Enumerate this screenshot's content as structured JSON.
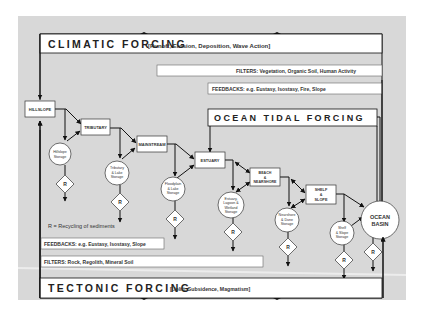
{
  "diagram": {
    "background_color": "#d8d8d8",
    "climatic_forcing": {
      "title": "CLIMATIC FORCING",
      "subtitle": "[Runoff, Erosion, Deposition, Wave Action]"
    },
    "filters_top": "FILTERS: Vegetation, Organic Soil, Human Activity",
    "feedbacks_top": "FEEDBACKS: e.g. Eustasy, Isostasy, Fire, Slope",
    "ocean_tidal_forcing": "OCEAN TIDAL FORCING",
    "nodes": {
      "hillslope": "HILLSLOPE",
      "tributary": "TRIBUTARY",
      "mainstream": "MAINSTREAM",
      "estuary": "ESTUARY",
      "beach_1": "BEACH",
      "beach_2": "&",
      "beach_3": "NEARSHORE",
      "shelf_1": "SHELF",
      "shelf_2": "&",
      "shelf_3": "SLOPE",
      "ocean_1": "OCEAN",
      "ocean_2": "BASIN"
    },
    "storages": {
      "hillslope_1": "Hillslope",
      "hillslope_2": "Storage",
      "tributary_1": "Tributary",
      "tributary_2": "& Lake",
      "tributary_3": "Storage",
      "floodplain_1": "Floodplain",
      "floodplain_2": "& Lake",
      "floodplain_3": "Storage",
      "estuary_1": "Estuary,",
      "estuary_2": "Lagoon &",
      "estuary_3": "Wetland",
      "estuary_4": "Storage",
      "nearshore_1": "Nearshore",
      "nearshore_2": "& Dune",
      "nearshore_3": "Storage",
      "shelf_1": "Shelf",
      "shelf_2": "& Slope",
      "shelf_3": "Storage"
    },
    "recycling_symbol": "R",
    "legend_recycling": "R = Recycling of sediments",
    "feedbacks_bottom": "FEEDBACKS: e.g. Eustasy, Isostasy, Slope",
    "filters_bottom": "FILTERS: Rock, Regolith, Mineral Soil",
    "tectonic_forcing": {
      "title": "TECTONIC FORCING",
      "subtitle": "[Uplift, Subsidence, Magmatism]"
    }
  }
}
